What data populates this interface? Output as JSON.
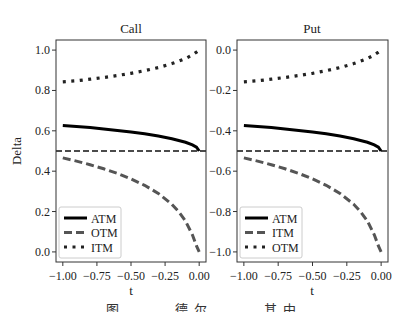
{
  "figure": {
    "caption": "图 ... 德尔 ... 其中"
  },
  "chart_data": [
    {
      "type": "line",
      "title": "Call",
      "xlabel": "t",
      "ylabel": "Delta",
      "xlim": [
        -1.05,
        0.05
      ],
      "ylim": [
        -0.05,
        1.05
      ],
      "xticks": [
        -1.0,
        -0.75,
        -0.5,
        -0.25,
        0.0
      ],
      "xtick_labels": [
        "−1.00",
        "−0.75",
        "−0.50",
        "−0.25",
        "0.00"
      ],
      "yticks": [
        0.0,
        0.2,
        0.4,
        0.6,
        0.8,
        1.0
      ],
      "ytick_labels": [
        "0.0",
        "0.2",
        "0.4",
        "0.6",
        "0.8",
        "1.0"
      ],
      "grid": false,
      "legend_position": "lower left",
      "hline": {
        "y": 0.5,
        "style": "dashed",
        "color": "#111111"
      },
      "x": [
        -1.0,
        -0.9,
        -0.8,
        -0.7,
        -0.6,
        -0.5,
        -0.4,
        -0.3,
        -0.2,
        -0.15,
        -0.1,
        -0.05,
        -0.02,
        0.0
      ],
      "series": [
        {
          "name": "ATM",
          "style": "solid",
          "color": "#000000",
          "values": [
            0.627,
            0.622,
            0.616,
            0.609,
            0.602,
            0.594,
            0.585,
            0.574,
            0.561,
            0.552,
            0.543,
            0.53,
            0.519,
            0.5
          ]
        },
        {
          "name": "OTM",
          "style": "dashed",
          "color": "#555555",
          "values": [
            0.466,
            0.45,
            0.432,
            0.412,
            0.389,
            0.362,
            0.33,
            0.29,
            0.236,
            0.199,
            0.153,
            0.085,
            0.03,
            0.0
          ]
        },
        {
          "name": "ITM",
          "style": "dotted",
          "color": "#222222",
          "values": [
            0.843,
            0.848,
            0.856,
            0.864,
            0.874,
            0.885,
            0.898,
            0.913,
            0.933,
            0.945,
            0.958,
            0.976,
            0.99,
            1.0
          ]
        }
      ]
    },
    {
      "type": "line",
      "title": "Put",
      "xlabel": "t",
      "ylabel": "",
      "xlim": [
        -1.05,
        0.05
      ],
      "ylim": [
        -1.05,
        0.05
      ],
      "xticks": [
        -1.0,
        -0.75,
        -0.5,
        -0.25,
        0.0
      ],
      "xtick_labels": [
        "−1.00",
        "−0.75",
        "−0.50",
        "−0.25",
        "0.00"
      ],
      "yticks": [
        -1.0,
        -0.8,
        -0.6,
        -0.4,
        -0.2,
        0.0
      ],
      "ytick_labels": [
        "−1.0",
        "−0.8",
        "−0.6",
        "−0.4",
        "−0.2",
        "0.0"
      ],
      "grid": false,
      "legend_position": "lower left",
      "hline": {
        "y": -0.5,
        "style": "dashed",
        "color": "#111111"
      },
      "x": [
        -1.0,
        -0.9,
        -0.8,
        -0.7,
        -0.6,
        -0.5,
        -0.4,
        -0.3,
        -0.2,
        -0.15,
        -0.1,
        -0.05,
        -0.02,
        0.0
      ],
      "series": [
        {
          "name": "ATM",
          "style": "solid",
          "color": "#000000",
          "values": [
            -0.373,
            -0.378,
            -0.384,
            -0.391,
            -0.398,
            -0.406,
            -0.415,
            -0.426,
            -0.439,
            -0.448,
            -0.457,
            -0.47,
            -0.481,
            -0.5
          ]
        },
        {
          "name": "ITM",
          "style": "dashed",
          "color": "#555555",
          "values": [
            -0.534,
            -0.55,
            -0.568,
            -0.588,
            -0.611,
            -0.638,
            -0.67,
            -0.71,
            -0.764,
            -0.801,
            -0.847,
            -0.915,
            -0.97,
            -1.0
          ]
        },
        {
          "name": "OTM",
          "style": "dotted",
          "color": "#222222",
          "values": [
            -0.157,
            -0.152,
            -0.144,
            -0.136,
            -0.126,
            -0.115,
            -0.102,
            -0.087,
            -0.067,
            -0.055,
            -0.042,
            -0.024,
            -0.01,
            0.0
          ]
        }
      ]
    }
  ]
}
